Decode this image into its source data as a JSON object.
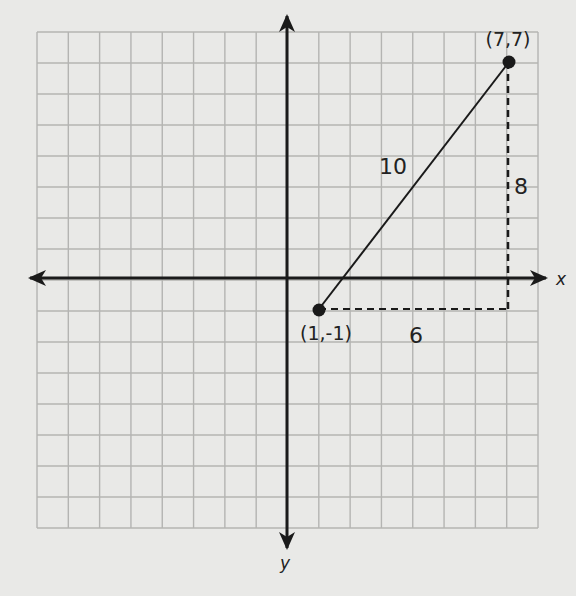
{
  "chart_data": {
    "type": "scatter",
    "title": "",
    "xlabel": "x",
    "ylabel": "y",
    "xlim": [
      -8,
      8
    ],
    "ylim": [
      -8,
      8
    ],
    "grid": true,
    "points": [
      {
        "label": "(1,-1)",
        "x": 1,
        "y": -1
      },
      {
        "label": "(7,7)",
        "x": 7,
        "y": 7
      }
    ],
    "segments": [
      {
        "from": [
          1,
          -1
        ],
        "to": [
          7,
          7
        ],
        "style": "solid",
        "label": "10"
      },
      {
        "from": [
          1,
          -1
        ],
        "to": [
          7,
          -1
        ],
        "style": "dashed",
        "label": "6"
      },
      {
        "from": [
          7,
          -1
        ],
        "to": [
          7,
          7
        ],
        "style": "dashed",
        "label": "8"
      }
    ]
  },
  "labels": {
    "point_a": "(1,-1)",
    "point_b": "(7,7)",
    "hypotenuse": "10",
    "horizontal_leg": "6",
    "vertical_leg": "8",
    "x_axis": "x",
    "y_axis": "y"
  },
  "colors": {
    "background": "#e9e9e7",
    "grid": "#b4b4b2",
    "ink": "#1a1a1a"
  }
}
